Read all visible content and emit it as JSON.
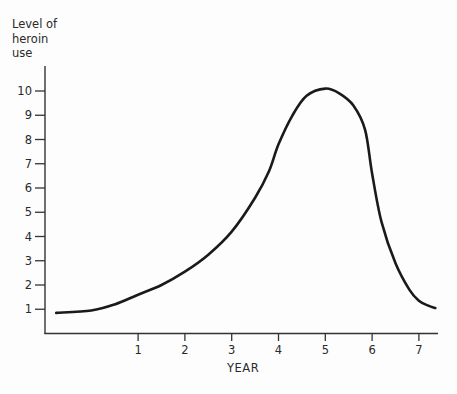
{
  "chart_data": {
    "type": "line",
    "title": "",
    "xlabel": "YEAR",
    "ylabel": "Level of\nheroin\nuse",
    "x_ticks": [
      "1",
      "2",
      "3",
      "4",
      "5",
      "6",
      "7"
    ],
    "y_ticks": [
      "1",
      "2",
      "3",
      "4",
      "5",
      "6",
      "7",
      "8",
      "9",
      "10"
    ],
    "xlim": [
      -0.8,
      7.4
    ],
    "ylim": [
      0,
      11.1
    ],
    "grid": false,
    "legend": null,
    "series": [
      {
        "name": "Level of heroin use",
        "color": "#1a1a1a",
        "x": [
          -0.75,
          0,
          0.5,
          1,
          1.5,
          2,
          2.5,
          3,
          3.5,
          3.8,
          4,
          4.3,
          4.6,
          5,
          5.3,
          5.6,
          5.85,
          6,
          6.2,
          6.5,
          6.8,
          7,
          7.2,
          7.35
        ],
        "y": [
          0.85,
          0.95,
          1.2,
          1.6,
          2.0,
          2.55,
          3.25,
          4.2,
          5.6,
          6.7,
          7.8,
          9.0,
          9.8,
          10.1,
          9.9,
          9.4,
          8.4,
          6.6,
          4.6,
          2.9,
          1.8,
          1.35,
          1.15,
          1.05
        ]
      }
    ]
  }
}
